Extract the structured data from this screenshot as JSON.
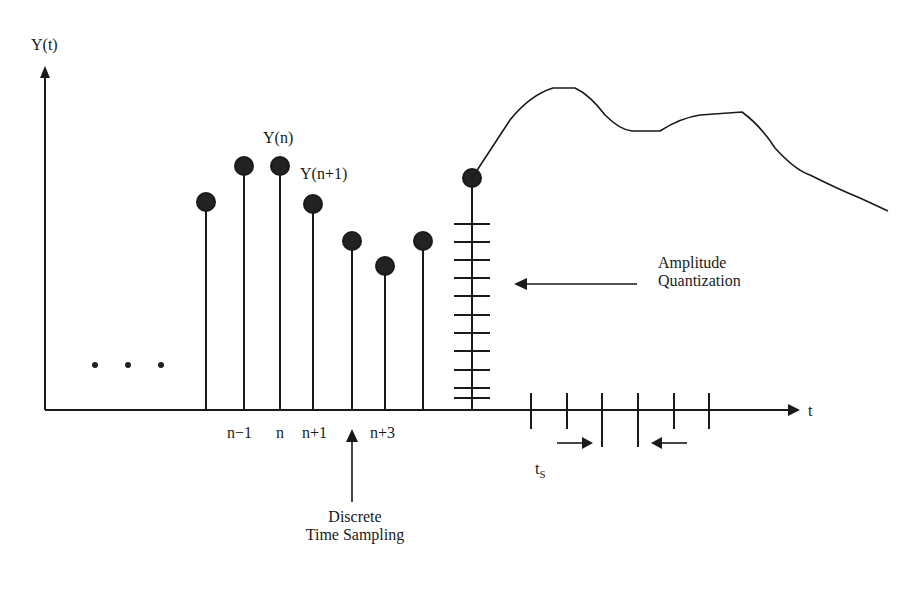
{
  "diagram": {
    "y_axis_label": "Y(t)",
    "x_axis_label": "t",
    "sample_labels": {
      "y_n": "Y(n)",
      "y_n1": "Y(n+1)"
    },
    "tick_labels": [
      "n−1",
      "n",
      "n+1",
      "n+3"
    ],
    "ellipsis": "...",
    "annotations": {
      "amplitude_line1": "Amplitude",
      "amplitude_line2": "Quantization",
      "discrete_line1": "Discrete",
      "discrete_line2": "Time Sampling",
      "ts_main": "t",
      "ts_sub": "S"
    },
    "samples": [
      {
        "x": 206,
        "top": 202
      },
      {
        "x": 244,
        "top": 166
      },
      {
        "x": 280,
        "top": 166
      },
      {
        "x": 313,
        "top": 204
      },
      {
        "x": 352,
        "top": 241
      },
      {
        "x": 385,
        "top": 266
      },
      {
        "x": 423,
        "top": 241
      },
      {
        "x": 472,
        "top": 178
      }
    ],
    "quantization_levels": 11,
    "time_ticks": 6,
    "colors": {
      "ink": "#1a1a1a",
      "background": "#ffffff"
    }
  }
}
